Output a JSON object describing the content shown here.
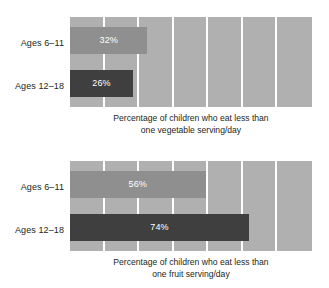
{
  "chart_data": [
    {
      "type": "bar",
      "orientation": "horizontal",
      "title": "",
      "caption_lines": [
        "Percentage of children who eat less than",
        "one vegetable serving/day"
      ],
      "categories": [
        "Ages 6–11",
        "Ages 12–18"
      ],
      "values": [
        32,
        26
      ],
      "value_labels": [
        "32%",
        "26%"
      ],
      "xlabel": "",
      "ylabel": "",
      "xlim": [
        0,
        100
      ],
      "grid": true,
      "gridline_count": 6,
      "legend": "none",
      "series_colors": [
        "#8f8f8f",
        "#3f3f3f"
      ],
      "panel_color": "#b0b0b0"
    },
    {
      "type": "bar",
      "orientation": "horizontal",
      "title": "",
      "caption_lines": [
        "Percentage of children who eat less than",
        "one fruit serving/day"
      ],
      "categories": [
        "Ages 6–11",
        "Ages 12–18"
      ],
      "values": [
        56,
        74
      ],
      "value_labels": [
        "56%",
        "74%"
      ],
      "xlabel": "",
      "ylabel": "",
      "xlim": [
        0,
        100
      ],
      "grid": true,
      "gridline_count": 6,
      "legend": "none",
      "series_colors": [
        "#8f8f8f",
        "#3f3f3f"
      ],
      "panel_color": "#b0b0b0"
    }
  ]
}
